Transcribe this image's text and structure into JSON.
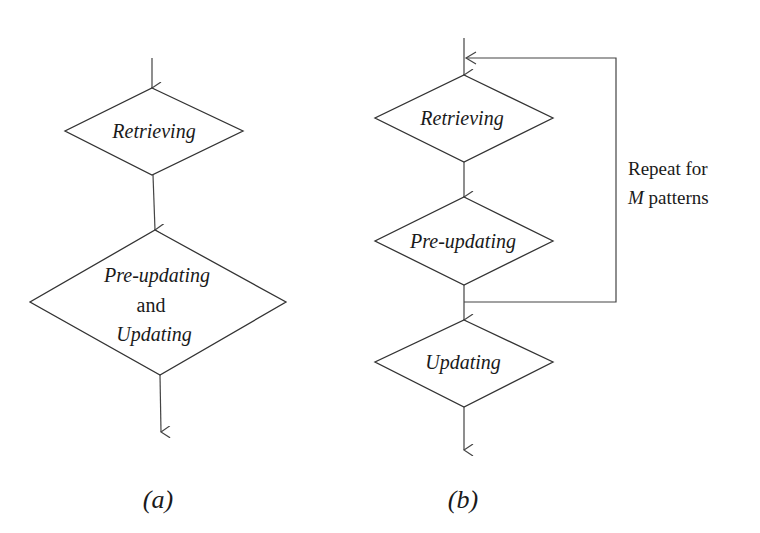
{
  "diagram_a": {
    "caption": "(a)",
    "nodes": [
      {
        "label": "Retrieving"
      },
      {
        "label_line1": "Pre-updating",
        "label_line2": "and",
        "label_line3": "Updating"
      }
    ]
  },
  "diagram_b": {
    "caption": "(b)",
    "nodes": [
      {
        "label": "Retrieving"
      },
      {
        "label": "Pre-updating"
      },
      {
        "label": "Updating"
      }
    ],
    "loop_note": {
      "line1": "Repeat for",
      "line2_italic": "M",
      "line2_rest": " patterns"
    }
  },
  "colors": {
    "stroke": "#333333",
    "text": "#1a1a1a",
    "background": "#ffffff"
  }
}
